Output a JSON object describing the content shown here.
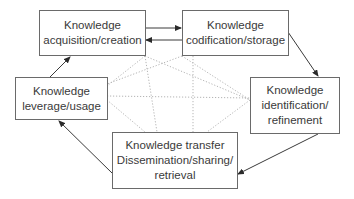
{
  "diagram": {
    "nodes": [
      {
        "id": "acquisition",
        "lines": [
          "Knowledge",
          "acquisition/creation"
        ]
      },
      {
        "id": "codification",
        "lines": [
          "Knowledge",
          "codification/storage"
        ]
      },
      {
        "id": "identification",
        "lines": [
          "Knowledge",
          "identification/",
          "refinement"
        ]
      },
      {
        "id": "transfer",
        "lines": [
          "Knowledge transfer",
          "Dissemination/sharing/",
          "retrieval"
        ]
      },
      {
        "id": "leverage",
        "lines": [
          "Knowledge",
          "leverage/usage"
        ]
      }
    ],
    "solid_edges": [
      {
        "from": "acquisition",
        "to": "codification"
      },
      {
        "from": "codification",
        "to": "acquisition"
      },
      {
        "from": "codification",
        "to": "identification"
      },
      {
        "from": "identification",
        "to": "transfer"
      },
      {
        "from": "transfer",
        "to": "leverage"
      },
      {
        "from": "leverage",
        "to": "acquisition"
      }
    ],
    "dotted_edges": [
      {
        "from": "acquisition",
        "to": "identification"
      },
      {
        "from": "acquisition",
        "to": "transfer"
      },
      {
        "from": "codification",
        "to": "leverage"
      },
      {
        "from": "codification",
        "to": "transfer"
      },
      {
        "from": "leverage",
        "to": "identification"
      }
    ],
    "colors": {
      "line": "#3a3a3a",
      "dotted": "#b5b5b5",
      "border": "#6a6a6a"
    }
  }
}
